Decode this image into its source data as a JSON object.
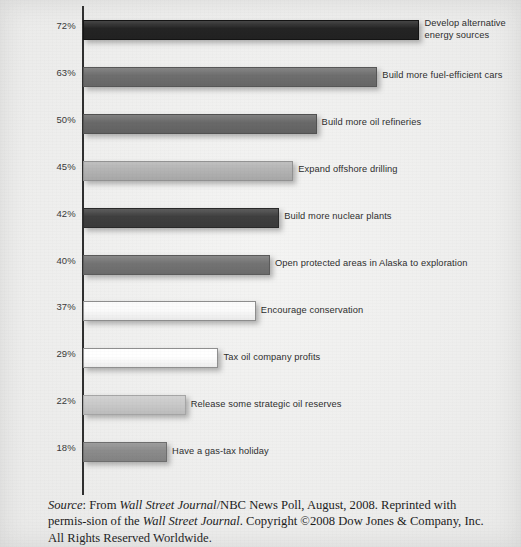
{
  "chart_data": {
    "type": "bar",
    "orientation": "horizontal",
    "title": "",
    "xlabel": "",
    "ylabel": "",
    "xlim": [
      0,
      72
    ],
    "grid": false,
    "legend": null,
    "categories": [
      "Develop alternative\nenergy sources",
      "Build more fuel-efficient cars",
      "Build more oil refineries",
      "Expand offshore drilling",
      "Build more nuclear plants",
      "Open protected areas in Alaska to exploration",
      "Encourage conservation",
      "Tax oil company profits",
      "Release some strategic oil reserves",
      "Have a gas-tax holiday"
    ],
    "values": [
      72,
      63,
      50,
      45,
      42,
      40,
      37,
      29,
      22,
      18
    ],
    "value_labels": [
      "72%",
      "63%",
      "50%",
      "45%",
      "42%",
      "40%",
      "37%",
      "29%",
      "22%",
      "18%"
    ],
    "bar_colors": [
      "#242424",
      "#6e6e6e",
      "#696969",
      "#b4b4b4",
      "#3f3f3f",
      "#737373",
      "#fbfbfb",
      "#ffffff",
      "#cacaca",
      "#8c8c8c"
    ],
    "bar_border_colors": [
      "#141414",
      "#575757",
      "#525252",
      "#939393",
      "#2a2a2a",
      "#5b5b5b",
      "#8d8d8d",
      "#909090",
      "#a6a6a6",
      "#6e6e6e"
    ],
    "bars": [
      {
        "label": "Develop alternative\nenergy sources",
        "value": 72,
        "value_label": "72%",
        "color": "#242424",
        "border": "#141414"
      },
      {
        "label": "Build more fuel-efficient cars",
        "value": 63,
        "value_label": "63%",
        "color": "#6e6e6e",
        "border": "#575757"
      },
      {
        "label": "Build more oil refineries",
        "value": 50,
        "value_label": "50%",
        "color": "#696969",
        "border": "#525252"
      },
      {
        "label": "Expand offshore drilling",
        "value": 45,
        "value_label": "45%",
        "color": "#b4b4b4",
        "border": "#939393"
      },
      {
        "label": "Build more nuclear plants",
        "value": 42,
        "value_label": "42%",
        "color": "#3f3f3f",
        "border": "#2a2a2a"
      },
      {
        "label": "Open protected areas in Alaska to exploration",
        "value": 40,
        "value_label": "40%",
        "color": "#737373",
        "border": "#5b5b5b"
      },
      {
        "label": "Encourage conservation",
        "value": 37,
        "value_label": "37%",
        "color": "#fbfbfb",
        "border": "#8d8d8d"
      },
      {
        "label": "Tax oil company profits",
        "value": 29,
        "value_label": "29%",
        "color": "#ffffff",
        "border": "#909090"
      },
      {
        "label": "Release some strategic oil reserves",
        "value": 22,
        "value_label": "22%",
        "color": "#cacaca",
        "border": "#a6a6a6"
      },
      {
        "label": "Have a gas-tax holiday",
        "value": 18,
        "value_label": "18%",
        "color": "#8c8c8c",
        "border": "#6e6e6e"
      }
    ]
  },
  "caption": {
    "source_word": "Source",
    "text_1": ": From ",
    "italic_1": "Wall Street Journal",
    "text_2": "/NBC News Poll, August, 2008. Reprinted with permis-sion of the ",
    "italic_2": "Wall Street Journal",
    "text_3": ". Copyright ©2008 Dow Jones & Company, Inc. All Rights Reserved Worldwide."
  }
}
